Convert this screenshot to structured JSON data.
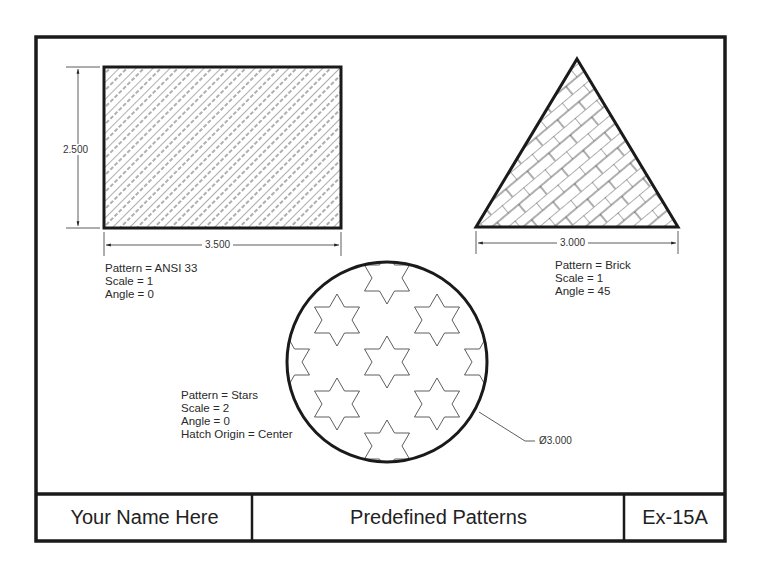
{
  "drawing": {
    "rectangle": {
      "width_dim": "3.500",
      "height_dim": "2.500",
      "label": [
        "Pattern = ANSI 33",
        "Scale = 1",
        "Angle = 0"
      ]
    },
    "triangle": {
      "base_dim": "3.000",
      "label": [
        "Pattern = Brick",
        "Scale = 1",
        "Angle = 45"
      ]
    },
    "circle": {
      "diameter_dim": "Ø3.000",
      "label": [
        "Pattern = Stars",
        "Scale = 2",
        "Angle = 0",
        "Hatch Origin = Center"
      ]
    }
  },
  "title_block": {
    "name": "Your Name Here",
    "title": "Predefined Patterns",
    "sheet": "Ex-15A"
  },
  "colors": {
    "line": "#1a1a1a",
    "hatch": "#333333",
    "background": "#ffffff"
  }
}
